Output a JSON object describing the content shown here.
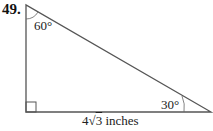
{
  "problem_number": "49.",
  "diagram": {
    "type": "right-triangle",
    "angles": {
      "top": "60°",
      "bottom_right": "30°",
      "bottom_left": "right-angle"
    },
    "side_label": {
      "coefficient": "4",
      "radical": "3",
      "unit": "inches",
      "text": "4√3 inches"
    },
    "stroke_color": "#555555"
  }
}
